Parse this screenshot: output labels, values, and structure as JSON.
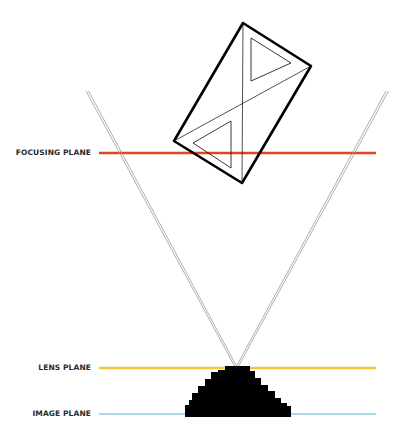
{
  "diagram": {
    "title": "",
    "labels": {
      "focusing_plane": "FOCUSING PLANE",
      "lens_plane": "LENS PLANE",
      "image_plane": "IMAGE PLANE"
    },
    "colors": {
      "focusing_plane": "#e2441f",
      "lens_plane": "#f2c740",
      "image_plane": "#add6ec",
      "rays": "#9a9a9a",
      "object_outline": "#000000",
      "lens_body": "#000000"
    },
    "planes": {
      "focusing_plane_y": 153,
      "lens_plane_y": 368,
      "image_plane_y": 414,
      "x_start": 99,
      "x_end": 376
    },
    "rays": {
      "apex": [
        236,
        367
      ],
      "left_end": [
        87,
        91
      ],
      "right_end": [
        387,
        91
      ]
    },
    "object": {
      "shape": "rotated rectangle with two triangles",
      "corners": [
        [
          243,
          23
        ],
        [
          311,
          66
        ],
        [
          242,
          183
        ],
        [
          174,
          141
        ]
      ]
    }
  }
}
